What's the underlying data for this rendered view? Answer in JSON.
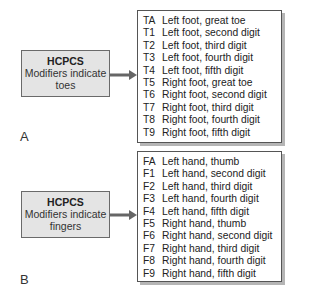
{
  "panels": [
    {
      "label": "A",
      "box": {
        "title": "HCPCS",
        "subtitle_line1": "Modifiers indicate",
        "subtitle_line2": "toes"
      },
      "rows": [
        {
          "code": "TA",
          "desc": "Left foot, great toe"
        },
        {
          "code": "T1",
          "desc": "Left foot, second digit"
        },
        {
          "code": "T2",
          "desc": "Left foot, third digit"
        },
        {
          "code": "T3",
          "desc": "Left foot, fourth digit"
        },
        {
          "code": "T4",
          "desc": "Left foot, fifth digit"
        },
        {
          "code": "T5",
          "desc": "Right foot, great toe"
        },
        {
          "code": "T6",
          "desc": "Right foot, second digit"
        },
        {
          "code": "T7",
          "desc": "Right foot, third digit"
        },
        {
          "code": "T8",
          "desc": "Right foot, fourth digit"
        },
        {
          "code": "T9",
          "desc": "Right foot, fifth digit"
        }
      ]
    },
    {
      "label": "B",
      "box": {
        "title": "HCPCS",
        "subtitle_line1": "Modifiers indicate",
        "subtitle_line2": "fingers"
      },
      "rows": [
        {
          "code": "FA",
          "desc": "Left hand, thumb"
        },
        {
          "code": "F1",
          "desc": "Left hand, second digit"
        },
        {
          "code": "F2",
          "desc": "Left hand, third digit"
        },
        {
          "code": "F3",
          "desc": "Left hand, fourth digit"
        },
        {
          "code": "F4",
          "desc": "Left hand, fifth digit"
        },
        {
          "code": "F5",
          "desc": "Right hand, thumb"
        },
        {
          "code": "F6",
          "desc": "Right hand, second digit"
        },
        {
          "code": "F7",
          "desc": "Right hand, third digit"
        },
        {
          "code": "F8",
          "desc": "Right hand, fourth digit"
        },
        {
          "code": "F9",
          "desc": "Right hand, fifth digit"
        }
      ]
    }
  ],
  "colors": {
    "box_fill": "#e4e4e4",
    "arrow": "#666666",
    "shadow": "#b5b5b5"
  }
}
